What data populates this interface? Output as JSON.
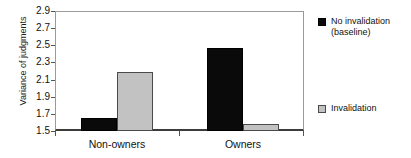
{
  "chart_data": {
    "type": "bar",
    "title": "",
    "xlabel": "",
    "ylabel": "Variance of judgments",
    "categories": [
      "Non-owners",
      "Owners"
    ],
    "series": [
      {
        "name": "No invalidation (baseline)",
        "color": "#0a0a0a",
        "values": [
          1.65,
          2.47
        ]
      },
      {
        "name": "Invalidation",
        "color": "#c2c2c2",
        "values": [
          2.19,
          1.58
        ]
      }
    ],
    "ylim": [
      1.5,
      2.9
    ],
    "yticks": [
      "1.5",
      "1.7",
      "1.9",
      "2.1",
      "2.3",
      "2.5",
      "2.7",
      "2.9"
    ],
    "ytick_values": [
      1.5,
      1.7,
      1.9,
      2.1,
      2.3,
      2.5,
      2.7,
      2.9
    ],
    "grid": false,
    "legend_position": "right"
  },
  "legend": {
    "items": [
      {
        "label": "No invalidation\n(baseline)",
        "swatch": "dark-square-swatch"
      },
      {
        "label": "Invalidation",
        "swatch": "light-square-swatch"
      }
    ]
  }
}
